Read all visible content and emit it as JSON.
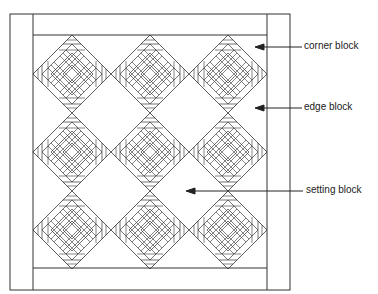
{
  "diagram": {
    "labels": {
      "corner": "corner block",
      "edge": "edge  block",
      "setting": "setting block"
    },
    "grid": {
      "rows": 3,
      "cols": 3
    },
    "colors": {
      "line": "#333333",
      "background": "#ffffff"
    }
  }
}
